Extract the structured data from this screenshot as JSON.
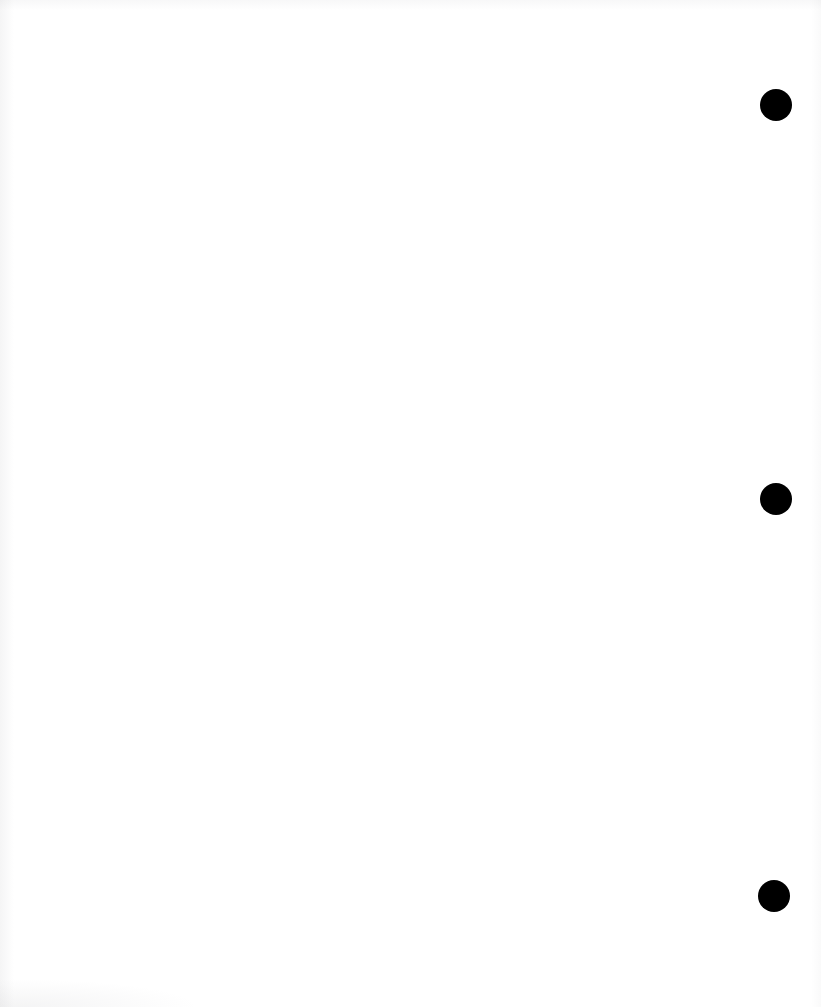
{
  "page": {
    "label": "scanned-blank-page",
    "width": 821,
    "height": 1007,
    "background_color": "#ffffff",
    "visible_text": ""
  },
  "marks": {
    "color": "#000000",
    "shape": "filled-circle",
    "count": 3,
    "items": [
      {
        "name": "mark-dot-top",
        "cx": 776,
        "cy": 105,
        "r": 16
      },
      {
        "name": "mark-dot-middle",
        "cx": 776,
        "cy": 499,
        "r": 16
      },
      {
        "name": "mark-dot-bottom",
        "cx": 774,
        "cy": 896,
        "r": 16
      }
    ]
  }
}
